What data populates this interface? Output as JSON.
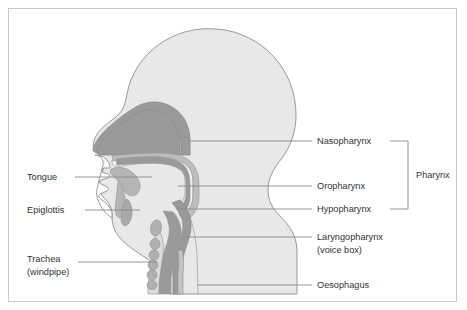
{
  "figure": {
    "border_color": "#c9c9c9",
    "background_color": "#ffffff"
  },
  "colors": {
    "head_fill": "#e8e8e8",
    "cavity_dark": "#9a9a9a",
    "cavity_mid": "#bdbdbd",
    "airway_light": "#f2f2f2",
    "outline": "#8e8e8e",
    "leader_line": "#8a8a8a",
    "label_text": "#333333"
  },
  "labels": {
    "left": [
      {
        "id": "tongue",
        "text": "Tongue",
        "x": 27,
        "y": 180
      },
      {
        "id": "epiglottis",
        "text": "Epiglottis",
        "x": 27,
        "y": 213
      },
      {
        "id": "trachea",
        "text": "Trachea",
        "x": 27,
        "y": 262
      },
      {
        "id": "trachea-sub",
        "text": "(windpipe)",
        "x": 27,
        "y": 275
      }
    ],
    "right": [
      {
        "id": "nasopharynx",
        "text": "Nasopharynx",
        "x": 317,
        "y": 144
      },
      {
        "id": "oropharynx",
        "text": "Oropharynx",
        "x": 317,
        "y": 189
      },
      {
        "id": "hypopharynx",
        "text": "Hypopharynx",
        "x": 317,
        "y": 212
      },
      {
        "id": "laryngopharynx",
        "text": "Laryngopharynx",
        "x": 317,
        "y": 240
      },
      {
        "id": "laryngopharynx-sub",
        "text": "(voice box)",
        "x": 317,
        "y": 253
      },
      {
        "id": "oesophagus",
        "text": "Oesophagus",
        "x": 317,
        "y": 288
      }
    ],
    "bracket": {
      "id": "pharynx",
      "text": "Pharynx",
      "x": 416,
      "y": 175
    }
  },
  "structures": [
    {
      "id": "head-skull",
      "name": "head-outline"
    },
    {
      "id": "nasal-cavity",
      "name": "nasal-cavity"
    },
    {
      "id": "oral-cavity",
      "name": "oral-cavity"
    },
    {
      "id": "tongue-body",
      "name": "tongue"
    },
    {
      "id": "epiglottis-flap",
      "name": "epiglottis"
    },
    {
      "id": "soft-palate",
      "name": "soft-palate"
    },
    {
      "id": "pharynx-tube",
      "name": "pharynx"
    },
    {
      "id": "trachea-tube",
      "name": "trachea"
    },
    {
      "id": "oesophagus-tube",
      "name": "oesophagus"
    },
    {
      "id": "tracheal-rings",
      "name": "tracheal-rings"
    },
    {
      "id": "spine-vertebrae",
      "name": "cervical-vertebrae"
    }
  ]
}
